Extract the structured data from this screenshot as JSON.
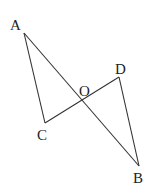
{
  "diagram": {
    "type": "geometry",
    "points": {
      "A": {
        "label": "A",
        "x": 24,
        "y": 33,
        "lx": 10,
        "ly": 30
      },
      "B": {
        "label": "B",
        "x": 139,
        "y": 166,
        "lx": 133,
        "ly": 183
      },
      "C": {
        "label": "C",
        "x": 45,
        "y": 123,
        "lx": 37,
        "ly": 140
      },
      "D": {
        "label": "D",
        "x": 119,
        "y": 77,
        "lx": 115,
        "ly": 74
      },
      "O": {
        "label": "O",
        "x": 83,
        "y": 100,
        "lx": 79,
        "ly": 96
      }
    },
    "segments": [
      [
        "A",
        "B"
      ],
      [
        "A",
        "C"
      ],
      [
        "C",
        "D"
      ],
      [
        "D",
        "B"
      ]
    ],
    "stroke_color": "#333333",
    "background": "#ffffff"
  }
}
